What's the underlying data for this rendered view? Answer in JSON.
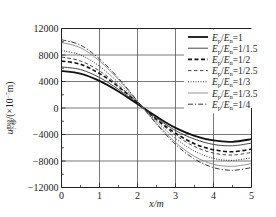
{
  "chart_data": {
    "type": "line",
    "title": "",
    "xlabel": "x/m",
    "ylabel": "u_max/(×10^-7 m)",
    "ylabel_parts": {
      "symbol": "u",
      "sup": "max",
      "sub": "下移",
      "unit": "/(×10",
      "exp": "−7",
      "unit_end": "m)"
    },
    "xlim": [
      0,
      5
    ],
    "ylim": [
      -12000,
      12000
    ],
    "xticks": [
      0,
      1,
      2,
      3,
      4,
      5
    ],
    "xtick_labels": [
      "0",
      "1",
      "2",
      "3",
      "4",
      "5"
    ],
    "yticks": [
      12000,
      8000,
      4000,
      0,
      -4000,
      -8000,
      -12000
    ],
    "ytick_labels": [
      "12000",
      "8000",
      "4000",
      "0",
      "−4000",
      "−8000",
      "−12000"
    ],
    "grid": true,
    "legend_position": "top-right",
    "x": [
      0,
      0.5,
      1,
      1.5,
      2,
      2.5,
      3,
      3.5,
      4,
      4.5,
      5
    ],
    "series": [
      {
        "name": "Ep/En=1",
        "label_parts": [
          "1"
        ],
        "style": "solid-thick",
        "values": [
          5600,
          5200,
          4100,
          2500,
          600,
          -1300,
          -3000,
          -4200,
          -4900,
          -5100,
          -4700
        ]
      },
      {
        "name": "Ep/En=1/1.5",
        "label_parts": [
          "1/1.5"
        ],
        "style": "solid-thin",
        "values": [
          6200,
          5800,
          4600,
          2800,
          700,
          -1500,
          -3400,
          -4700,
          -5500,
          -5700,
          -5300
        ]
      },
      {
        "name": "Ep/En=1/2",
        "label_parts": [
          "1/2"
        ],
        "style": "dashed-thick",
        "values": [
          7100,
          6600,
          5200,
          3200,
          800,
          -1700,
          -3800,
          -5400,
          -6300,
          -6600,
          -6200
        ]
      },
      {
        "name": "Ep/En=1/2.5",
        "label_parts": [
          "1/2.5"
        ],
        "style": "dashed-thin",
        "values": [
          7700,
          7100,
          5600,
          3400,
          850,
          -1800,
          -4100,
          -5800,
          -6800,
          -7100,
          -6700
        ]
      },
      {
        "name": "Ep/En=1/3",
        "label_parts": [
          "1/3"
        ],
        "style": "dotted",
        "values": [
          8700,
          8000,
          6300,
          3800,
          900,
          -2000,
          -4600,
          -6500,
          -7600,
          -7900,
          -7500
        ]
      },
      {
        "name": "Ep/En=1/3.5",
        "label_parts": [
          "1/3.5"
        ],
        "style": "solid-light",
        "values": [
          9900,
          9100,
          7100,
          4300,
          1000,
          -2300,
          -5200,
          -7300,
          -8500,
          -8800,
          -8400
        ]
      },
      {
        "name": "Ep/En=1/4",
        "label_parts": [
          "1/4"
        ],
        "style": "dash-dot",
        "values": [
          10300,
          9500,
          7400,
          4500,
          1050,
          -2400,
          -5500,
          -7700,
          -9000,
          -9400,
          -9000
        ]
      }
    ]
  }
}
